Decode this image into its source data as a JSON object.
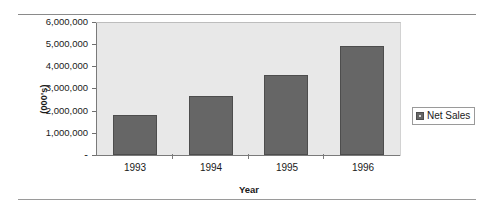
{
  "chart_data": {
    "type": "bar",
    "title": "",
    "categories": [
      "1993",
      "1994",
      "1995",
      "1996"
    ],
    "values": [
      1800000,
      2700000,
      3650000,
      4975000
    ],
    "series": [
      {
        "name": "Net Sales",
        "values": [
          1800000,
          2700000,
          3650000,
          4975000
        ]
      }
    ],
    "xlabel": "Year",
    "ylabel": "(000's)",
    "ylim": [
      0,
      6000000
    ],
    "ytick_labels": [
      "6,000,000",
      "5,000,000",
      "4,000,000",
      "3,000,000",
      "2,000,000",
      "1,000,000",
      "-"
    ],
    "ytick_values": [
      6000000,
      5000000,
      4000000,
      3000000,
      2000000,
      1000000,
      0
    ],
    "grid": false,
    "legend_position": "right",
    "legend_entries": [
      "Net Sales"
    ],
    "colors": {
      "bar_fill": "#666666",
      "bar_border": "#4d4d4d",
      "plot_background": "#e8e8e8",
      "axis": "#7a7a7a",
      "text": "#1a1a1a"
    }
  }
}
